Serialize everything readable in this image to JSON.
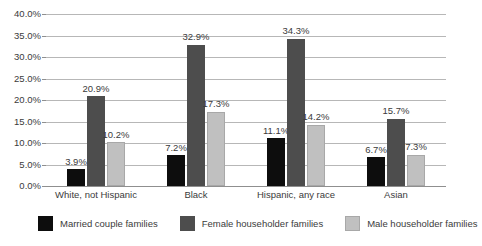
{
  "chart_data": {
    "type": "bar",
    "title": "",
    "subtitle": "",
    "xlabel": "",
    "ylabel": "",
    "ylim": [
      0,
      40
    ],
    "y_tick_labels": [
      "0.0%",
      "5.0%",
      "10.0%",
      "15.0%",
      "20.0%",
      "25.0%",
      "30.0%",
      "35.0%",
      "40.0%"
    ],
    "y_tick_values": [
      0,
      5,
      10,
      15,
      20,
      25,
      30,
      35,
      40
    ],
    "grid": true,
    "legend_position": "bottom",
    "categories": [
      "White, not Hispanic",
      "Black",
      "Hispanic, any race",
      "Asian"
    ],
    "series": [
      {
        "name": "Married couple families",
        "color": "#0d0d0d",
        "values": [
          3.9,
          7.2,
          11.1,
          6.7
        ],
        "labels": [
          "3.9%",
          "7.2%",
          "11.1%",
          "6.7%"
        ]
      },
      {
        "name": "Female householder families",
        "color": "#4d4d4d",
        "values": [
          20.9,
          32.9,
          34.3,
          15.7
        ],
        "labels": [
          "20.9%",
          "32.9%",
          "34.3%",
          "15.7%"
        ]
      },
      {
        "name": "Male householder families",
        "color": "#c0c0c0",
        "values": [
          10.2,
          17.3,
          14.2,
          7.3
        ],
        "labels": [
          "10.2%",
          "17.3%",
          "14.2%",
          "7.3%"
        ]
      }
    ]
  }
}
